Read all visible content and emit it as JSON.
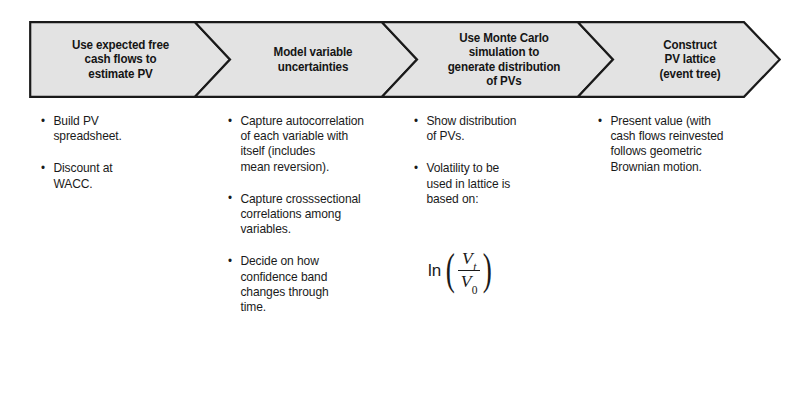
{
  "diagram": {
    "type": "process-chevron-flow",
    "stage_count": 4,
    "banner": {
      "fill_color": "#e3e3e3",
      "stroke_color": "#1a1a1a",
      "background_color": "#ffffff"
    },
    "stages": [
      {
        "id": "stage-expected-free-cash-flows",
        "header": "Use expected free\ncash flows to\nestimate PV",
        "bullets": [
          "Build PV\nspreadsheet.",
          "Discount at\nWACC."
        ]
      },
      {
        "id": "stage-model-variable-uncertainties",
        "header": "Model variable\nuncertainties",
        "bullets": [
          "Capture autocorrelation\nof each variable with\nitself (includes\nmean reversion).",
          "Capture crosssectional\ncorrelations among\nvariables.",
          "Decide on how\nconfidence band\nchanges through\ntime."
        ]
      },
      {
        "id": "stage-monte-carlo-simulation",
        "header": "Use Monte Carlo\nsimulation to\ngenerate distribution\nof PVs",
        "bullets": [
          "Show distribution\nof PVs.",
          "Volatility to be\nused in lattice is\nbased on:"
        ],
        "formula": {
          "id": "volatility-formula",
          "expression": "ln(V_t / V_0)",
          "function_label": "ln",
          "numerator_base": "V",
          "numerator_subscript": "t",
          "denominator_base": "V",
          "denominator_subscript": "0"
        }
      },
      {
        "id": "stage-construct-pv-lattice",
        "header": "Construct\nPV lattice\n(event tree)",
        "bullets": [
          "Present value (with\ncash flows reinvested\nfollows geometric\nBrownian motion."
        ]
      }
    ]
  }
}
